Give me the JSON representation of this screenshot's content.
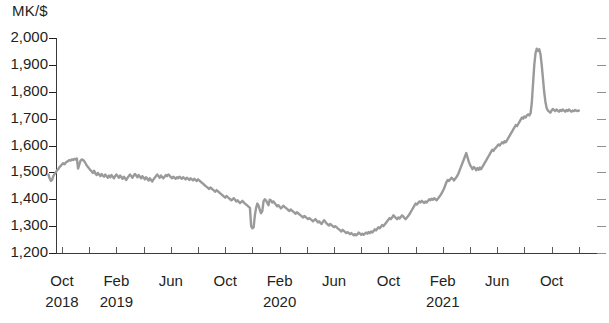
{
  "chart_data": {
    "type": "line",
    "title": "",
    "subtitle": "",
    "ylabel": "MK/$",
    "xlabel": "",
    "ylim": [
      1200,
      2000
    ],
    "y_ticks": [
      "1,200",
      "1,300",
      "1,400",
      "1,500",
      "1,600",
      "1,700",
      "1,800",
      "1,900",
      "2,000"
    ],
    "y_tick_values": [
      1200,
      1300,
      1400,
      1500,
      1600,
      1700,
      1800,
      1900,
      2000
    ],
    "grid": false,
    "legend": "none",
    "right_axis_ticks": true,
    "x_tick_labels": [
      {
        "month": "Oct",
        "year": "2018"
      },
      {
        "month": "Feb",
        "year": "2019"
      },
      {
        "month": "Jun",
        "year": ""
      },
      {
        "month": "Oct",
        "year": ""
      },
      {
        "month": "Feb",
        "year": "2020"
      },
      {
        "month": "Jun",
        "year": ""
      },
      {
        "month": "Oct",
        "year": ""
      },
      {
        "month": "Feb",
        "year": "2021"
      },
      {
        "month": "Jun",
        "year": ""
      },
      {
        "month": "Oct",
        "year": ""
      }
    ],
    "series": [
      {
        "name": "MK/$ exchange rate",
        "color": "#9a9a9a",
        "x_start": "2018-09",
        "x_end": "2021-12",
        "values": [
          1492,
          1478,
          1468,
          1472,
          1486,
          1494,
          1500,
          1508,
          1512,
          1520,
          1524,
          1530,
          1534,
          1530,
          1536,
          1540,
          1542,
          1546,
          1544,
          1548,
          1546,
          1550,
          1548,
          1552,
          1514,
          1530,
          1544,
          1548,
          1546,
          1542,
          1534,
          1526,
          1520,
          1514,
          1508,
          1504,
          1498,
          1506,
          1496,
          1490,
          1498,
          1492,
          1486,
          1494,
          1488,
          1484,
          1492,
          1486,
          1480,
          1488,
          1482,
          1490,
          1484,
          1478,
          1486,
          1492,
          1486,
          1480,
          1488,
          1482,
          1476,
          1484,
          1478,
          1472,
          1480,
          1486,
          1492,
          1486,
          1480,
          1488,
          1494,
          1488,
          1482,
          1490,
          1484,
          1478,
          1486,
          1480,
          1474,
          1482,
          1476,
          1470,
          1478,
          1472,
          1466,
          1474,
          1480,
          1486,
          1492,
          1486,
          1480,
          1488,
          1482,
          1478,
          1484,
          1490,
          1486,
          1492,
          1488,
          1482,
          1478,
          1484,
          1480,
          1476,
          1482,
          1478,
          1484,
          1480,
          1476,
          1482,
          1478,
          1474,
          1480,
          1476,
          1472,
          1478,
          1474,
          1470,
          1476,
          1472,
          1468,
          1474,
          1470,
          1466,
          1462,
          1458,
          1454,
          1450,
          1446,
          1442,
          1438,
          1444,
          1440,
          1436,
          1432,
          1428,
          1434,
          1430,
          1426,
          1422,
          1418,
          1414,
          1410,
          1406,
          1412,
          1408,
          1404,
          1400,
          1396,
          1400,
          1404,
          1398,
          1392,
          1396,
          1390,
          1386,
          1390,
          1394,
          1388,
          1384,
          1380,
          1376,
          1372,
          1368,
          1300,
          1292,
          1296,
          1340,
          1368,
          1384,
          1376,
          1360,
          1348,
          1356,
          1392,
          1400,
          1396,
          1386,
          1378,
          1398,
          1396,
          1388,
          1392,
          1386,
          1380,
          1374,
          1378,
          1372,
          1366,
          1370,
          1376,
          1372,
          1368,
          1364,
          1360,
          1356,
          1362,
          1358,
          1354,
          1350,
          1346,
          1352,
          1348,
          1344,
          1340,
          1336,
          1332,
          1338,
          1334,
          1330,
          1326,
          1330,
          1326,
          1322,
          1318,
          1322,
          1326,
          1320,
          1314,
          1318,
          1312,
          1308,
          1316,
          1322,
          1316,
          1310,
          1306,
          1302,
          1308,
          1304,
          1300,
          1296,
          1300,
          1296,
          1292,
          1288,
          1284,
          1280,
          1286,
          1282,
          1278,
          1274,
          1278,
          1274,
          1270,
          1274,
          1270,
          1266,
          1270,
          1266,
          1270,
          1276,
          1272,
          1268,
          1272,
          1268,
          1272,
          1276,
          1272,
          1278,
          1274,
          1280,
          1276,
          1282,
          1288,
          1284,
          1290,
          1296,
          1292,
          1298,
          1304,
          1300,
          1306,
          1312,
          1318,
          1324,
          1330,
          1326,
          1332,
          1340,
          1336,
          1330,
          1326,
          1332,
          1328,
          1334,
          1340,
          1336,
          1330,
          1326,
          1332,
          1338,
          1344,
          1352,
          1360,
          1368,
          1376,
          1384,
          1380,
          1386,
          1392,
          1388,
          1394,
          1390,
          1386,
          1392,
          1388,
          1394,
          1400,
          1396,
          1402,
          1398,
          1404,
          1400,
          1396,
          1402,
          1408,
          1414,
          1422,
          1430,
          1440,
          1452,
          1464,
          1472,
          1468,
          1474,
          1480,
          1476,
          1470,
          1476,
          1482,
          1490,
          1500,
          1512,
          1524,
          1536,
          1548,
          1560,
          1572,
          1556,
          1540,
          1528,
          1520,
          1512,
          1520,
          1516,
          1508,
          1516,
          1510,
          1518,
          1512,
          1520,
          1528,
          1536,
          1544,
          1552,
          1560,
          1568,
          1576,
          1584,
          1580,
          1588,
          1592,
          1598,
          1604,
          1600,
          1606,
          1612,
          1608,
          1616,
          1612,
          1620,
          1628,
          1636,
          1644,
          1652,
          1660,
          1668,
          1676,
          1672,
          1680,
          1688,
          1696,
          1704,
          1700,
          1708,
          1704,
          1712,
          1716,
          1712,
          1720,
          1760,
          1830,
          1900,
          1944,
          1960,
          1952,
          1958,
          1940,
          1900,
          1850,
          1800,
          1762,
          1740,
          1730,
          1726,
          1722,
          1730,
          1736,
          1732,
          1728,
          1734,
          1730,
          1726,
          1732,
          1728,
          1734,
          1730,
          1726,
          1732,
          1728,
          1734,
          1730,
          1726,
          1730,
          1728,
          1732,
          1730,
          1728,
          1730
        ]
      }
    ]
  }
}
